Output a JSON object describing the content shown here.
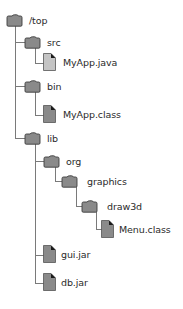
{
  "diagram": {
    "type": "directory-tree",
    "colors": {
      "folder_fill": "#8a8a8a",
      "folder_stroke": "#3c3c3c",
      "source_file_fill": "#c4c4c4",
      "binary_file_fill": "#8a8a8a",
      "line": "#7a7a7a"
    },
    "nodes": [
      {
        "label": "/top",
        "icon": "folder-icon",
        "depth": 0
      },
      {
        "label": "src",
        "icon": "folder-icon",
        "depth": 1
      },
      {
        "label": "MyApp.java",
        "icon": "file-icon",
        "depth": 2
      },
      {
        "label": "bin",
        "icon": "folder-icon",
        "depth": 1
      },
      {
        "label": "MyApp.class",
        "icon": "file-icon",
        "depth": 2
      },
      {
        "label": "lib",
        "icon": "folder-icon",
        "depth": 1
      },
      {
        "label": "org",
        "icon": "folder-icon",
        "depth": 2
      },
      {
        "label": "graphics",
        "icon": "folder-icon",
        "depth": 3
      },
      {
        "label": "draw3d",
        "icon": "folder-icon",
        "depth": 4
      },
      {
        "label": "Menu.class",
        "icon": "file-icon",
        "depth": 5
      },
      {
        "label": "gui.jar",
        "icon": "file-icon",
        "depth": 2
      },
      {
        "label": "db.jar",
        "icon": "file-icon",
        "depth": 2
      }
    ]
  }
}
